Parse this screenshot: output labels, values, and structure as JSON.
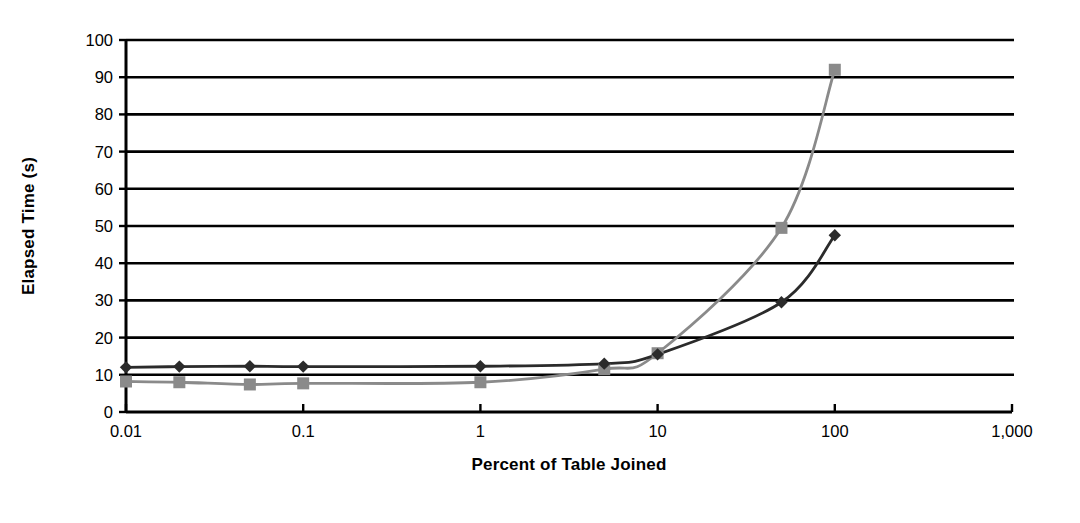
{
  "chart_data": {
    "type": "line",
    "title": "",
    "xlabel": "Percent of Table Joined",
    "ylabel": "Elapsed Time (s)",
    "xscale": "log",
    "xlim": [
      0.01,
      1000
    ],
    "ylim": [
      0,
      100
    ],
    "grid": true,
    "legend": "none",
    "xticks": [
      "0.01",
      "0.1",
      "1",
      "10",
      "100",
      "1,000"
    ],
    "xtick_values": [
      0.01,
      0.1,
      1,
      10,
      100,
      1000
    ],
    "yticks": [
      "0",
      "10",
      "20",
      "30",
      "40",
      "50",
      "60",
      "70",
      "80",
      "90",
      "100"
    ],
    "ytick_values": [
      0,
      10,
      20,
      30,
      40,
      50,
      60,
      70,
      80,
      90,
      100
    ],
    "x": [
      0.01,
      0.02,
      0.05,
      0.1,
      1,
      5,
      10,
      50,
      100
    ],
    "series": [
      {
        "name": "series-diamond-dark",
        "marker": "diamond",
        "color": "#2b2b2b",
        "values": [
          12.0,
          12.2,
          12.3,
          12.2,
          12.3,
          13.0,
          15.5,
          29.5,
          47.5
        ]
      },
      {
        "name": "series-square-gray",
        "marker": "square",
        "color": "#8a8a8a",
        "values": [
          8.2,
          8.0,
          7.4,
          7.7,
          8.0,
          11.5,
          15.8,
          49.5,
          92.0
        ]
      }
    ]
  },
  "colors": {
    "axis": "#000000",
    "gridline": "#000000",
    "background": "#ffffff",
    "series_dark": "#2b2b2b",
    "series_gray": "#8a8a8a"
  }
}
